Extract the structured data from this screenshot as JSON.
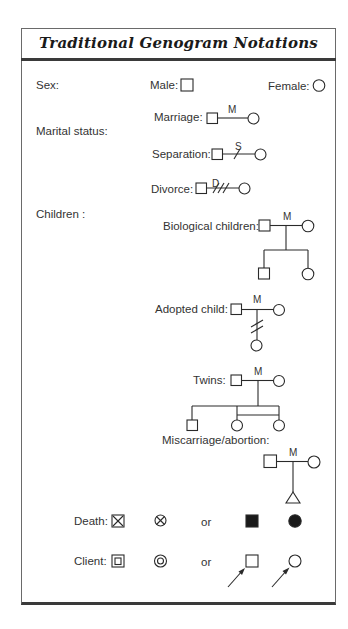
{
  "title": "Traditional Genogram Notations",
  "sections": {
    "sex": "Sex:",
    "marital": "Marital status:",
    "children": "Children :"
  },
  "labels": {
    "male": "Male:",
    "female": "Female:",
    "marriage": "Marriage:",
    "separation": "Separation:",
    "divorce": "Divorce:",
    "biological": "Biological children:",
    "adopted": "Adopted child:",
    "twins": "Twins:",
    "miscarriage": "Miscarriage/abortion:",
    "death": "Death:",
    "client": "Client:",
    "or1": "or",
    "or2": "or"
  },
  "line_tags": {
    "marriage": "M",
    "separation": "S",
    "divorce": "D",
    "biological": "M",
    "adopted": "M",
    "twins": "M",
    "miscarriage": "M"
  },
  "symbols": [
    "male-square",
    "female-circle",
    "death-male-x-square",
    "death-female-x-circle",
    "death-male-filled-square",
    "death-female-filled-circle",
    "client-male-double-square",
    "client-female-double-circle",
    "client-male-arrow-square",
    "client-female-arrow-circle",
    "miscarriage-triangle"
  ],
  "colors": {
    "stroke": "#2a2a2a",
    "border": "#3a3a3a",
    "background": "#ffffff"
  }
}
